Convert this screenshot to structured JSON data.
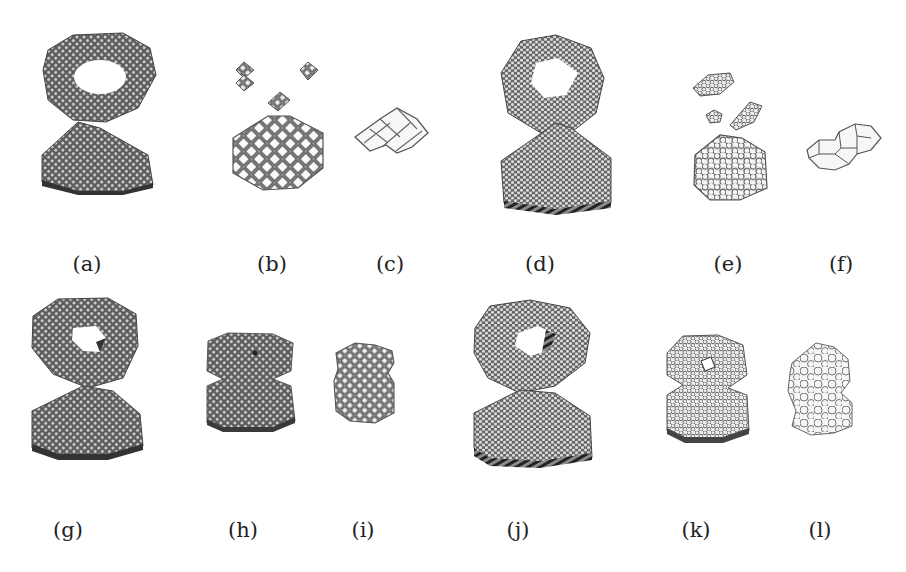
{
  "figure": {
    "panels": [
      {
        "id": "a",
        "label": "(a)",
        "description": "Dense square-lattice mesh: torus above hexagonal prism"
      },
      {
        "id": "b",
        "label": "(b)",
        "description": "Coarsened square-lattice mesh with detached clusters"
      },
      {
        "id": "c",
        "label": "(c)",
        "description": "Coarsest square-lattice mesh, few cells"
      },
      {
        "id": "d",
        "label": "(d)",
        "description": "Dense hexagonal-lattice mesh: torus above prism"
      },
      {
        "id": "e",
        "label": "(e)",
        "description": "Coarsened hexagonal mesh with detached clusters"
      },
      {
        "id": "f",
        "label": "(f)",
        "description": "Coarsest hexagonal mesh, two cells"
      },
      {
        "id": "g",
        "label": "(g)",
        "description": "Dense square-lattice mesh, alternate view"
      },
      {
        "id": "h",
        "label": "(h)",
        "description": "Coarsened square-lattice mesh, compact figure-eight"
      },
      {
        "id": "i",
        "label": "(i)",
        "description": "Coarsest square-lattice mesh, compact"
      },
      {
        "id": "j",
        "label": "(j)",
        "description": "Dense hexagonal mesh, alternate view"
      },
      {
        "id": "k",
        "label": "(k)",
        "description": "Coarsened hexagonal mesh, compact figure-eight"
      },
      {
        "id": "l",
        "label": "(l)",
        "description": "Coarsest hexagonal/polygonal mesh, compact"
      }
    ]
  },
  "colors": {
    "dense_fill": "#6e6e6e",
    "dense_dark": "#3a3a3a",
    "mesh_line": "#555555",
    "light_fill": "#ececec",
    "background": "#ffffff",
    "label_text": "#222222"
  }
}
